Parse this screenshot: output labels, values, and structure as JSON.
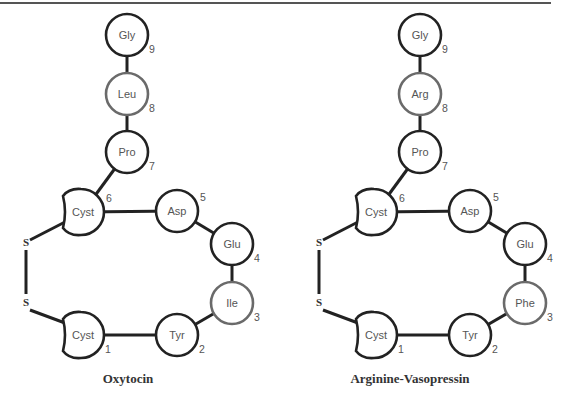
{
  "header": {
    "text": ""
  },
  "molecules": [
    {
      "name": "Oxytocin",
      "offset_x": 0,
      "residues": [
        {
          "pos": 1,
          "label": "Cyst",
          "shape": "cyst",
          "x": 83,
          "y": 335,
          "highlight": false
        },
        {
          "pos": 2,
          "label": "Tyr",
          "shape": "circle",
          "x": 177,
          "y": 335,
          "highlight": false
        },
        {
          "pos": 3,
          "label": "Ile",
          "shape": "circle",
          "x": 232,
          "y": 303,
          "highlight": true
        },
        {
          "pos": 4,
          "label": "Glu",
          "shape": "circle",
          "x": 232,
          "y": 244,
          "highlight": false
        },
        {
          "pos": 5,
          "label": "Asp",
          "shape": "circle",
          "x": 177,
          "y": 211,
          "highlight": false
        },
        {
          "pos": 6,
          "label": "Cyst",
          "shape": "cyst",
          "x": 83,
          "y": 212,
          "highlight": false
        },
        {
          "pos": 7,
          "label": "Pro",
          "shape": "circle",
          "x": 127,
          "y": 152,
          "highlight": false
        },
        {
          "pos": 8,
          "label": "Leu",
          "shape": "circle",
          "x": 127,
          "y": 94,
          "highlight": true
        },
        {
          "pos": 9,
          "label": "Gly",
          "shape": "circle",
          "x": 127,
          "y": 35,
          "highlight": false
        }
      ],
      "disulfide": [
        {
          "label": "S",
          "x": 26,
          "y": 246
        },
        {
          "label": "S",
          "x": 26,
          "y": 306
        }
      ]
    },
    {
      "name": "Arginine-Vasopressin",
      "offset_x": 293,
      "residues": [
        {
          "pos": 1,
          "label": "Cyst",
          "shape": "cyst",
          "x": 83,
          "y": 335,
          "highlight": false
        },
        {
          "pos": 2,
          "label": "Tyr",
          "shape": "circle",
          "x": 177,
          "y": 335,
          "highlight": false
        },
        {
          "pos": 3,
          "label": "Phe",
          "shape": "circle",
          "x": 232,
          "y": 303,
          "highlight": true
        },
        {
          "pos": 4,
          "label": "Glu",
          "shape": "circle",
          "x": 232,
          "y": 244,
          "highlight": false
        },
        {
          "pos": 5,
          "label": "Asp",
          "shape": "circle",
          "x": 177,
          "y": 211,
          "highlight": false
        },
        {
          "pos": 6,
          "label": "Cyst",
          "shape": "cyst",
          "x": 83,
          "y": 212,
          "highlight": false
        },
        {
          "pos": 7,
          "label": "Pro",
          "shape": "circle",
          "x": 127,
          "y": 152,
          "highlight": false
        },
        {
          "pos": 8,
          "label": "Arg",
          "shape": "circle",
          "x": 127,
          "y": 94,
          "highlight": true
        },
        {
          "pos": 9,
          "label": "Gly",
          "shape": "circle",
          "x": 127,
          "y": 35,
          "highlight": false
        }
      ],
      "disulfide": [
        {
          "label": "S",
          "x": 26,
          "y": 246
        },
        {
          "label": "S",
          "x": 26,
          "y": 306
        }
      ]
    }
  ],
  "titles": [
    {
      "text": "Oxytocin",
      "x": 128,
      "y": 383
    },
    {
      "text": "Arginine-Vasopressin",
      "x": 410,
      "y": 383
    }
  ],
  "colors": {
    "bond": "#222222",
    "ring": "#222222",
    "ring_highlight": "#6a6a6a",
    "text": "#555555"
  }
}
